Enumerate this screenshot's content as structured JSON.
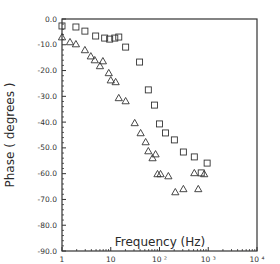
{
  "chart_data": {
    "type": "scatter",
    "title": "",
    "xlabel": "Frequency (Hz)",
    "ylabel": "Phase ( degrees )",
    "xscale": "log",
    "xlim": [
      1,
      10000
    ],
    "ylim": [
      -90,
      0
    ],
    "x_ticks": [
      {
        "value": 1,
        "label": "1"
      },
      {
        "value": 10,
        "label": "10"
      },
      {
        "value": 100,
        "label": "10 ²"
      },
      {
        "value": 1000,
        "label": "10 ³"
      },
      {
        "value": 10000,
        "label": "10 ⁴"
      }
    ],
    "y_ticks": [
      {
        "value": 0,
        "label": "0.0"
      },
      {
        "value": -10,
        "label": "-10.0"
      },
      {
        "value": -20,
        "label": "-20.0"
      },
      {
        "value": -30,
        "label": "-30.0"
      },
      {
        "value": -40,
        "label": "-40.0"
      },
      {
        "value": -50,
        "label": "-50.0"
      },
      {
        "value": -60,
        "label": "-60.0"
      },
      {
        "value": -70,
        "label": "-70.0"
      },
      {
        "value": -80,
        "label": "-80.0"
      },
      {
        "value": -90,
        "label": "-90.0"
      }
    ],
    "grid": false,
    "legend": null,
    "series": [
      {
        "name": "squares",
        "marker": "square",
        "points": [
          [
            1.0,
            -2.7
          ],
          [
            1.93,
            -3.1
          ],
          [
            2.95,
            -4.7
          ],
          [
            4.9,
            -6.6
          ],
          [
            7.5,
            -7.4
          ],
          [
            9.5,
            -7.8
          ],
          [
            12.1,
            -7.4
          ],
          [
            14.6,
            -7.0
          ],
          [
            20.2,
            -10.9
          ],
          [
            39,
            -16.7
          ],
          [
            59,
            -27.5
          ],
          [
            79,
            -33.4
          ],
          [
            100,
            -40.7
          ],
          [
            133,
            -44.2
          ],
          [
            202,
            -46.9
          ],
          [
            309,
            -51.6
          ],
          [
            518,
            -53.5
          ],
          [
            718,
            -59.7
          ],
          [
            949,
            -55.9
          ]
        ]
      },
      {
        "name": "triangles",
        "marker": "triangle",
        "points": [
          [
            1.0,
            -7.0
          ],
          [
            1.46,
            -8.9
          ],
          [
            1.93,
            -9.7
          ],
          [
            2.95,
            -12.0
          ],
          [
            3.9,
            -14.4
          ],
          [
            4.7,
            -15.9
          ],
          [
            6.9,
            -16.3
          ],
          [
            6.0,
            -18.2
          ],
          [
            9.1,
            -20.9
          ],
          [
            10,
            -23.7
          ],
          [
            12.6,
            -24.4
          ],
          [
            14.6,
            -30.6
          ],
          [
            20.2,
            -31.8
          ],
          [
            31,
            -40.3
          ],
          [
            41,
            -44.2
          ],
          [
            52,
            -47.7
          ],
          [
            59,
            -51.2
          ],
          [
            83,
            -52.4
          ],
          [
            72,
            -53.9
          ],
          [
            91,
            -60.1
          ],
          [
            105,
            -60.1
          ],
          [
            152,
            -60.9
          ],
          [
            211,
            -67.1
          ],
          [
            309,
            -65.9
          ],
          [
            518,
            -59.7
          ],
          [
            826,
            -60.1
          ],
          [
            624,
            -65.9
          ]
        ]
      }
    ]
  },
  "colors": {
    "axis": "#333333",
    "marker": "#333333",
    "background": "#ffffff"
  }
}
